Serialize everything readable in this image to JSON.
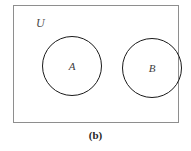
{
  "figure": {
    "caption": "(b)",
    "universe": {
      "label": "U",
      "name": "universal-set"
    },
    "sets": [
      {
        "label": "A",
        "name": "set-a"
      },
      {
        "label": "B",
        "name": "set-b"
      }
    ],
    "colors": {
      "background": "#ffffff",
      "box_border": "#8e8e8e",
      "circle_border": "#1a1a1a",
      "label_text": "#3d3d3d",
      "caption_text": "#262626"
    }
  }
}
